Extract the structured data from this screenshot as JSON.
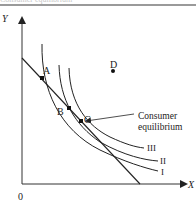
{
  "header": {
    "cropped_caption": "Consumer equilibrium"
  },
  "diagram": {
    "type": "indifference-curve-diagram",
    "axes": {
      "x_label": "X",
      "y_label": "Y",
      "origin_label": "0"
    },
    "points": [
      {
        "id": "A",
        "label": "A"
      },
      {
        "id": "B",
        "label": "B"
      },
      {
        "id": "C",
        "label": "C"
      },
      {
        "id": "D",
        "label": "D"
      }
    ],
    "curves": [
      {
        "id": "I",
        "label": "I"
      },
      {
        "id": "II",
        "label": "II"
      },
      {
        "id": "III",
        "label": "III"
      }
    ],
    "annotation": {
      "line1": "Consumer",
      "line2": "equilibrium",
      "points_to": "C"
    },
    "colors": {
      "line": "#222222",
      "axis": "#333333",
      "rule": "#9a9a9a"
    }
  }
}
